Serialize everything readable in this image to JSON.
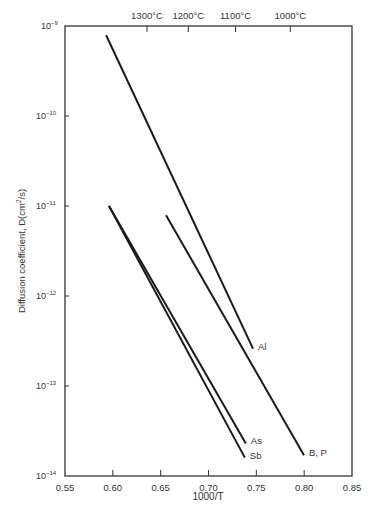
{
  "chart_data": {
    "type": "line",
    "title": "",
    "xlabel": "1000/T",
    "ylabel": "Diffusion coefficient, D(cm²/s)",
    "ylabel_parts": {
      "main": "Diffusion coefficient, D(cm",
      "sup": "2",
      "tail": "/s)"
    },
    "xscale": "linear",
    "yscale": "log",
    "xlim": [
      0.55,
      0.85
    ],
    "ylim": [
      1e-14,
      1e-09
    ],
    "grid": false,
    "legend": "inline labels at line ends",
    "x_ticks": [
      {
        "value": 0.55,
        "label": "0.55"
      },
      {
        "value": 0.6,
        "label": "0.60"
      },
      {
        "value": 0.65,
        "label": "0.65"
      },
      {
        "value": 0.7,
        "label": "0.70"
      },
      {
        "value": 0.75,
        "label": "0.75"
      },
      {
        "value": 0.8,
        "label": "0.80"
      },
      {
        "value": 0.85,
        "label": "0.85"
      }
    ],
    "y_ticks": [
      {
        "exp": -9,
        "base": "10",
        "sup": "−9"
      },
      {
        "exp": -10,
        "base": "10",
        "sup": "−10"
      },
      {
        "exp": -11,
        "base": "10",
        "sup": "−11"
      },
      {
        "exp": -12,
        "base": "10",
        "sup": "−12"
      },
      {
        "exp": -13,
        "base": "10",
        "sup": "−13"
      },
      {
        "exp": -14,
        "base": "10",
        "sup": "−14"
      }
    ],
    "top_axis": {
      "label": "Temperature",
      "ticks": [
        {
          "value": 0.6357,
          "label": "1300°C"
        },
        {
          "value": 0.6789,
          "label": "1200°C"
        },
        {
          "value": 0.7283,
          "label": "1100°C"
        },
        {
          "value": 0.7855,
          "label": "1000°C"
        }
      ]
    },
    "series": [
      {
        "name": "Al",
        "x": [
          0.593,
          0.7465
        ],
        "y": [
          7.9e-10,
          2.6e-13
        ],
        "label_pos": "end-right"
      },
      {
        "name": "B, P",
        "x": [
          0.6556,
          0.7998
        ],
        "y": [
          7.9e-12,
          1.7e-14
        ],
        "label_pos": "end-right"
      },
      {
        "name": "As",
        "x": [
          0.596,
          0.739
        ],
        "y": [
          1e-11,
          2.3e-14
        ],
        "label_pos": "end-right"
      },
      {
        "name": "Sb",
        "x": [
          0.596,
          0.738
        ],
        "y": [
          1e-11,
          1.6e-14
        ],
        "label_pos": "end-right"
      }
    ]
  },
  "layout": {
    "plot": {
      "left": 65,
      "right": 352,
      "top": 26,
      "bottom": 476
    },
    "line_color": "#1a1a1a",
    "axis_color": "#333333"
  }
}
